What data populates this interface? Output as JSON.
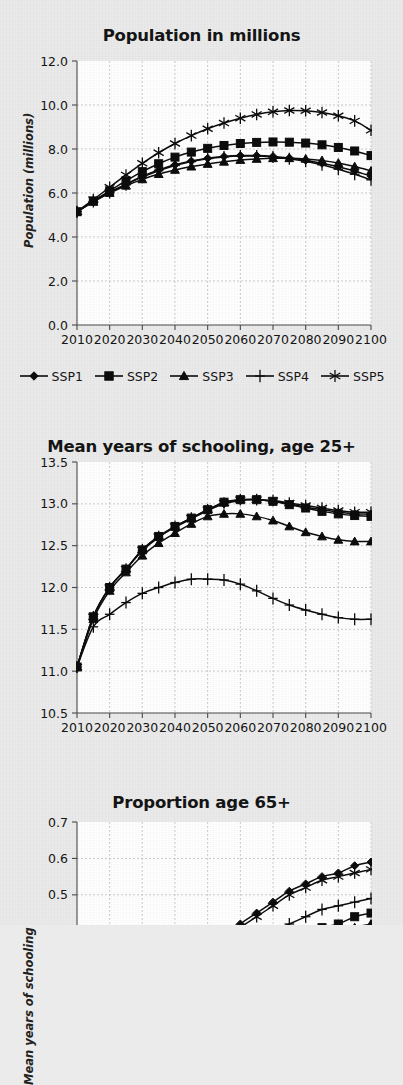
{
  "figure": {
    "background_color": "#ebebeb",
    "plot_background_color": "#ffffff",
    "series_color": "#0d0d0d",
    "grid_color": "#b9b9b9"
  },
  "legend": {
    "position": "below-first-panel",
    "items": [
      {
        "label": "SSP1",
        "marker": "diamond"
      },
      {
        "label": "SSP2",
        "marker": "square"
      },
      {
        "label": "SSP3",
        "marker": "triangle"
      },
      {
        "label": "SSP4",
        "marker": "plus"
      },
      {
        "label": "SSP5",
        "marker": "asterisk"
      }
    ]
  },
  "chart_data": [
    {
      "id": "population",
      "type": "line",
      "title": "Population in millions",
      "xlabel": "",
      "ylabel": "Population (millions)",
      "x": [
        2010,
        2015,
        2020,
        2025,
        2030,
        2035,
        2040,
        2045,
        2050,
        2055,
        2060,
        2065,
        2070,
        2075,
        2080,
        2085,
        2090,
        2095,
        2100
      ],
      "xticks": [
        2010,
        2020,
        2030,
        2040,
        2050,
        2060,
        2070,
        2080,
        2090,
        2100
      ],
      "yticks": [
        0.0,
        2.0,
        4.0,
        6.0,
        8.0,
        10.0,
        12.0
      ],
      "ytick_labels": [
        "0.0",
        "2.0",
        "4.0",
        "6.0",
        "8.0",
        "10.0",
        "12.0"
      ],
      "xlim": [
        2010,
        2100
      ],
      "ylim": [
        0.0,
        12.0
      ],
      "grid": true,
      "series": [
        {
          "name": "SSP1",
          "marker": "diamond",
          "values": [
            5.15,
            5.62,
            6.04,
            6.4,
            6.76,
            7.05,
            7.28,
            7.45,
            7.58,
            7.66,
            7.7,
            7.7,
            7.66,
            7.59,
            7.49,
            7.35,
            7.19,
            6.99,
            6.77
          ]
        },
        {
          "name": "SSP2",
          "marker": "square",
          "values": [
            5.15,
            5.64,
            6.1,
            6.55,
            6.97,
            7.33,
            7.63,
            7.86,
            8.03,
            8.16,
            8.25,
            8.3,
            8.32,
            8.31,
            8.27,
            8.19,
            8.07,
            7.91,
            7.7
          ]
        },
        {
          "name": "SSP3",
          "marker": "triangle",
          "values": [
            5.15,
            5.6,
            6.0,
            6.33,
            6.62,
            6.86,
            7.05,
            7.2,
            7.32,
            7.42,
            7.5,
            7.55,
            7.58,
            7.58,
            7.55,
            7.48,
            7.36,
            7.2,
            7.0
          ]
        },
        {
          "name": "SSP4",
          "marker": "plus",
          "values": [
            5.15,
            5.61,
            6.02,
            6.38,
            6.72,
            7.01,
            7.25,
            7.43,
            7.56,
            7.64,
            7.68,
            7.68,
            7.64,
            7.56,
            7.44,
            7.28,
            7.08,
            6.85,
            6.6
          ]
        },
        {
          "name": "SSP5",
          "marker": "asterisk",
          "values": [
            5.15,
            5.7,
            6.26,
            6.82,
            7.35,
            7.83,
            8.25,
            8.61,
            8.92,
            9.18,
            9.4,
            9.57,
            9.69,
            9.75,
            9.74,
            9.66,
            9.51,
            9.28,
            8.85
          ]
        }
      ]
    },
    {
      "id": "schooling",
      "type": "line",
      "title": "Mean years of schooling, age 25+",
      "xlabel": "",
      "ylabel": "Mean years of schooling",
      "x": [
        2010,
        2015,
        2020,
        2025,
        2030,
        2035,
        2040,
        2045,
        2050,
        2055,
        2060,
        2065,
        2070,
        2075,
        2080,
        2085,
        2090,
        2095,
        2100
      ],
      "xticks": [
        2010,
        2020,
        2030,
        2040,
        2050,
        2060,
        2070,
        2080,
        2090,
        2100
      ],
      "yticks": [
        10.5,
        11.0,
        11.5,
        12.0,
        12.5,
        13.0,
        13.5
      ],
      "ytick_labels": [
        "10.5",
        "11.0",
        "11.5",
        "12.0",
        "12.5",
        "13.0",
        "13.5"
      ],
      "xlim": [
        2010,
        2100
      ],
      "ylim": [
        10.5,
        13.5
      ],
      "grid": true,
      "series": [
        {
          "name": "SSP1",
          "marker": "diamond",
          "values": [
            11.05,
            11.65,
            12.0,
            12.22,
            12.44,
            12.6,
            12.72,
            12.82,
            12.92,
            13.0,
            13.04,
            13.05,
            13.03,
            13.0,
            12.96,
            12.93,
            12.9,
            12.88,
            12.88
          ]
        },
        {
          "name": "SSP2",
          "marker": "square",
          "values": [
            11.05,
            11.65,
            12.0,
            12.22,
            12.45,
            12.61,
            12.73,
            12.83,
            12.93,
            13.02,
            13.05,
            13.05,
            13.03,
            12.99,
            12.95,
            12.91,
            12.88,
            12.86,
            12.85
          ]
        },
        {
          "name": "SSP3",
          "marker": "triangle",
          "values": [
            11.05,
            11.62,
            11.96,
            12.18,
            12.38,
            12.53,
            12.65,
            12.76,
            12.85,
            12.88,
            12.88,
            12.85,
            12.8,
            12.73,
            12.66,
            12.61,
            12.57,
            12.55,
            12.55
          ]
        },
        {
          "name": "SSP4",
          "marker": "plus",
          "values": [
            11.05,
            11.53,
            11.68,
            11.82,
            11.93,
            12.0,
            12.06,
            12.1,
            12.1,
            12.09,
            12.04,
            11.96,
            11.87,
            11.79,
            11.73,
            11.68,
            11.64,
            11.62,
            11.62
          ]
        },
        {
          "name": "SSP5",
          "marker": "asterisk",
          "values": [
            11.05,
            11.65,
            12.0,
            12.22,
            12.45,
            12.61,
            12.73,
            12.83,
            12.93,
            13.01,
            13.05,
            13.05,
            13.04,
            13.01,
            12.98,
            12.95,
            12.92,
            12.9,
            12.9
          ]
        }
      ]
    },
    {
      "id": "proportion-65",
      "type": "line",
      "title": "Proportion age 65+",
      "xlabel": "",
      "ylabel": "",
      "x": [
        2010,
        2015,
        2020,
        2025,
        2030,
        2035,
        2040,
        2045,
        2050,
        2055,
        2060,
        2065,
        2070,
        2075,
        2080,
        2085,
        2090,
        2095,
        2100
      ],
      "xticks": [
        2010,
        2020,
        2030,
        2040,
        2050,
        2060,
        2070,
        2080,
        2090,
        2100
      ],
      "yticks": [
        0.5,
        0.6,
        0.7
      ],
      "ytick_labels": [
        "0.5",
        "0.6",
        "0.7"
      ],
      "xlim": [
        2010,
        2100
      ],
      "ylim": [
        0.0,
        0.7
      ],
      "grid": true,
      "cropped": true,
      "series": [
        {
          "name": "SSP1",
          "marker": "diamond",
          "values": [
            0.09,
            0.11,
            0.13,
            0.16,
            0.19,
            0.22,
            0.26,
            0.3,
            0.34,
            0.38,
            0.42,
            0.45,
            0.48,
            0.51,
            0.53,
            0.55,
            0.56,
            0.58,
            0.59
          ]
        },
        {
          "name": "SSP2",
          "marker": "square",
          "values": [
            0.09,
            0.1,
            0.12,
            0.14,
            0.16,
            0.19,
            0.21,
            0.24,
            0.26,
            0.29,
            0.31,
            0.33,
            0.35,
            0.37,
            0.39,
            0.41,
            0.42,
            0.44,
            0.45
          ]
        },
        {
          "name": "SSP3",
          "marker": "triangle",
          "values": [
            0.09,
            0.1,
            0.12,
            0.14,
            0.16,
            0.18,
            0.2,
            0.22,
            0.24,
            0.26,
            0.28,
            0.3,
            0.32,
            0.34,
            0.36,
            0.38,
            0.39,
            0.41,
            0.42
          ]
        },
        {
          "name": "SSP4",
          "marker": "plus",
          "values": [
            0.09,
            0.11,
            0.13,
            0.15,
            0.18,
            0.2,
            0.23,
            0.26,
            0.29,
            0.32,
            0.35,
            0.37,
            0.4,
            0.42,
            0.44,
            0.46,
            0.47,
            0.48,
            0.49
          ]
        },
        {
          "name": "SSP5",
          "marker": "asterisk",
          "values": [
            0.09,
            0.11,
            0.13,
            0.16,
            0.19,
            0.22,
            0.25,
            0.29,
            0.33,
            0.37,
            0.41,
            0.44,
            0.47,
            0.5,
            0.52,
            0.54,
            0.55,
            0.56,
            0.57
          ]
        }
      ]
    }
  ]
}
